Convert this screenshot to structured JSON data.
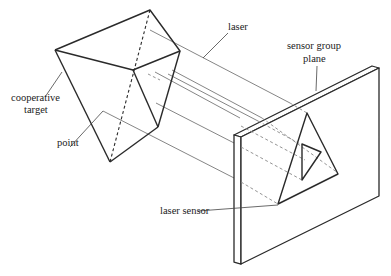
{
  "diagram": {
    "labels": {
      "laser": "laser",
      "sensor_group_plane_line1": "sensor group",
      "sensor_group_plane_line2": "plane",
      "cooperative_target_line1": "cooperative",
      "cooperative_target_line2": "target",
      "point": "point",
      "laser_sensor": "laser sensor"
    },
    "components": [
      "cooperative target (polyhedron)",
      "laser beams",
      "sensor group plane (panel)",
      "triangular sensor arrangement"
    ],
    "colors": {
      "line": "#2a2a2a",
      "beam": "#777777",
      "background": "#ffffff"
    }
  }
}
